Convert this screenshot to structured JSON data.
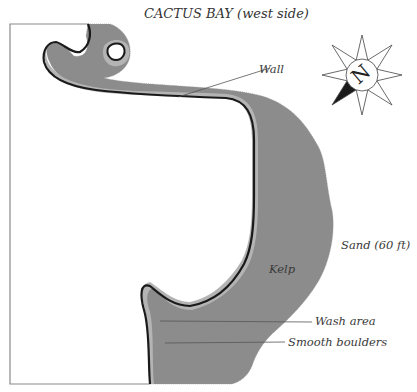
{
  "map": {
    "title": "CACTUS BAY (west side)",
    "labels": {
      "wall": "Wall",
      "sand": "Sand (60 ft)",
      "kelp": "Kelp",
      "wash_area": "Wash area",
      "smooth_boulders": "Smooth boulders"
    },
    "compass": {
      "north_label": "N",
      "icon": "compass-rose-icon"
    },
    "colors": {
      "kelp": "#8c8c8c",
      "shallows": "#b2b2b2",
      "wall_line": "#1a1a1a",
      "land": "#ffffff",
      "frame": "#888888",
      "label_text": "#3a3a3a"
    }
  }
}
